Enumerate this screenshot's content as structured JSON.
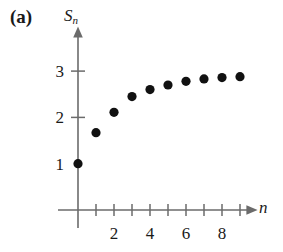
{
  "figure": {
    "panel_label": "(a)",
    "y_axis_symbol": "S",
    "y_axis_subscript": "n",
    "x_axis_symbol": "n"
  },
  "chart_data": {
    "type": "scatter",
    "title": "(a)",
    "xlabel": "n",
    "ylabel": "S_n",
    "x": [
      0,
      1,
      2,
      3,
      4,
      5,
      6,
      7,
      8,
      9
    ],
    "values": [
      1,
      1.67,
      2.11,
      2.45,
      2.6,
      2.7,
      2.78,
      2.83,
      2.86,
      2.88
    ],
    "series": [
      {
        "name": "S_n",
        "points": [
          {
            "n": 0,
            "S": 1
          },
          {
            "n": 1,
            "S": 1.67
          },
          {
            "n": 2,
            "S": 2.11
          },
          {
            "n": 3,
            "S": 2.45
          },
          {
            "n": 4,
            "S": 2.6
          },
          {
            "n": 5,
            "S": 2.7
          },
          {
            "n": 6,
            "S": 2.78
          },
          {
            "n": 7,
            "S": 2.83
          },
          {
            "n": 8,
            "S": 2.86
          },
          {
            "n": 9,
            "S": 2.88
          }
        ]
      }
    ],
    "xlim": [
      0,
      9.6
    ],
    "ylim": [
      0,
      3.45
    ],
    "x_ticks": [
      1,
      2,
      3,
      4,
      5,
      6,
      7,
      8,
      9
    ],
    "x_tick_labels": [
      {
        "value": 2,
        "label": "2"
      },
      {
        "value": 4,
        "label": "4"
      },
      {
        "value": 6,
        "label": "6"
      },
      {
        "value": 8,
        "label": "8"
      }
    ],
    "y_ticks": [
      2,
      3
    ],
    "y_tick_labels": [
      {
        "value": 1,
        "label": "1"
      },
      {
        "value": 2,
        "label": "2"
      },
      {
        "value": 3,
        "label": "3"
      }
    ],
    "grid": false,
    "legend": null,
    "marker": "filled-circle",
    "marker_color": "#111111",
    "axis_color": "#6b6b6b",
    "annotations": []
  }
}
